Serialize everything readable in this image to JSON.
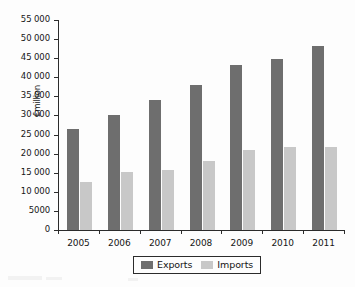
{
  "chart_data": {
    "type": "bar",
    "title": "",
    "subtitle": "",
    "xlabel": "",
    "ylabel": "£million",
    "categories": [
      "2005",
      "2006",
      "2007",
      "2008",
      "2009",
      "2010",
      "2011"
    ],
    "series": [
      {
        "name": "Exports",
        "color": "#6e6e6e",
        "values": [
          26500,
          30000,
          34000,
          38000,
          43300,
          44800,
          48300
        ]
      },
      {
        "name": "Imports",
        "color": "#c8c8c8",
        "values": [
          12700,
          15300,
          15600,
          18200,
          21000,
          21700,
          21700
        ]
      }
    ],
    "ylim": [
      0,
      55000
    ],
    "ytick_step": 5000,
    "ytick_labels": [
      "55 000",
      "50 000",
      "45 000",
      "40 000",
      "35 000",
      "30 000",
      "25 000",
      "20 000",
      "15 000",
      "10 000",
      "5000",
      "0"
    ],
    "ytick_values": [
      55000,
      50000,
      45000,
      40000,
      35000,
      30000,
      25000,
      20000,
      15000,
      10000,
      5000,
      0
    ],
    "grid": false,
    "legend_position": "bottom-center",
    "annotations": []
  },
  "legend": {
    "entries": [
      {
        "label": "Exports",
        "color": "#6e6e6e"
      },
      {
        "label": "Imports",
        "color": "#c8c8c8"
      }
    ]
  },
  "colors": {
    "exports": "#6e6e6e",
    "imports": "#c8c8c8",
    "axis": "#2b2b2b",
    "background": "#fdfdfd",
    "text": "#161616"
  }
}
